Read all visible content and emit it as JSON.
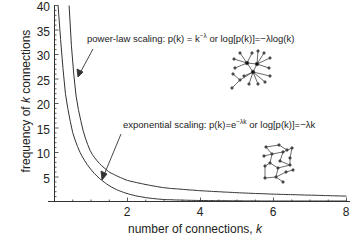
{
  "chart_data": {
    "type": "line",
    "title": "",
    "xlabel": "number of connections, k",
    "ylabel": "frequency of k connections",
    "xlim": [
      0,
      8.2
    ],
    "ylim": [
      0,
      40
    ],
    "x_ticks": [
      2,
      4,
      6,
      8
    ],
    "y_ticks": [
      5,
      10,
      15,
      20,
      25,
      30,
      35,
      40
    ],
    "grid": false,
    "legend": null,
    "series": [
      {
        "name": "power-law scaling",
        "formula": "p(k) = k^-λ",
        "x": [
          0.4,
          0.5,
          0.6,
          0.8,
          1.0,
          1.2,
          1.5,
          2.0,
          3.0,
          4.0,
          5.0,
          6.0,
          7.0,
          8.0
        ],
        "values": [
          40,
          28,
          21,
          14,
          10,
          8,
          6,
          4.3,
          2.8,
          2.2,
          1.8,
          1.5,
          1.3,
          1.1
        ]
      },
      {
        "name": "exponential scaling",
        "formula": "p(k) = e^-λk",
        "x": [
          0.1,
          0.2,
          0.3,
          0.5,
          0.7,
          1.0,
          1.3,
          1.6,
          2.0,
          2.5,
          3.0,
          4.0,
          6.0,
          8.0
        ],
        "values": [
          40,
          30,
          22,
          14,
          10,
          6.5,
          4.3,
          2.8,
          1.6,
          0.8,
          0.4,
          0.2,
          0.1,
          0.05
        ]
      }
    ],
    "annotations": [
      {
        "text": "power-law scaling: p(k) = k^-λ  or  log[p(k)]=−λlog(k)",
        "points_to": "power-law curve near k≈0.6"
      },
      {
        "text": "exponential scaling: p(k)=e^-λk or log[p(k)]=−λk",
        "points_to": "exponential curve near k≈1.3"
      }
    ],
    "insets": [
      {
        "name": "scale-free network diagram",
        "near": "power-law annotation"
      },
      {
        "name": "random network diagram",
        "near": "exponential annotation"
      }
    ]
  },
  "labels": {
    "xlabel_prefix": "number of connections, ",
    "xlabel_var": "k",
    "ylabel_prefix": "frequency of ",
    "ylabel_var": "k",
    "ylabel_suffix": " connections",
    "ann_power_main": "power-law scaling: p(k) = k",
    "ann_power_sup": "−λ",
    "ann_power_rest": "  or  log[p(k)]=−λlog(k)",
    "ann_exp_main": "exponential scaling: p(k)=e",
    "ann_exp_sup": "−λk",
    "ann_exp_rest": " or log[p(k)]=−λk",
    "x_ticks": [
      "2",
      "4",
      "6",
      "8"
    ],
    "y_ticks": [
      "5",
      "10",
      "15",
      "20",
      "25",
      "30",
      "35",
      "40"
    ]
  }
}
